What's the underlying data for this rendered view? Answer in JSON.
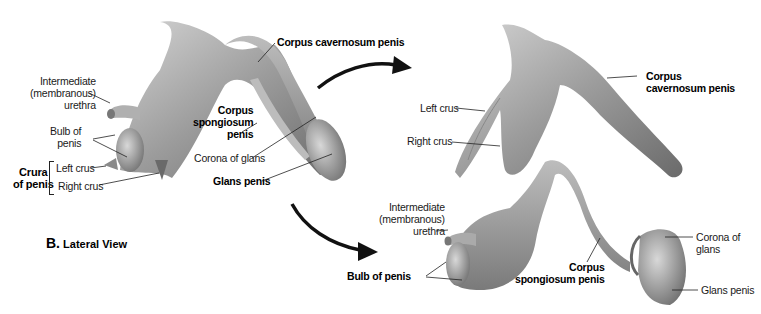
{
  "figure": {
    "caption_letter": "B.",
    "caption_text": "Lateral View"
  },
  "lateral_view_labels": {
    "intermediate_urethra": [
      "Intermediate",
      "(membranous)",
      "urethra"
    ],
    "bulb_of_penis": [
      "Bulb of",
      "penis"
    ],
    "crura_group": [
      "Crura",
      "of penis"
    ],
    "left_crus": "Left crus",
    "right_crus": "Right crus",
    "corpus_cavernosum": "Corpus cavernosum penis",
    "corpus_spongiosum": [
      "Corpus",
      "spongiosum",
      "penis"
    ],
    "corona_of_glans": "Corona of glans",
    "glans_penis": "Glans penis"
  },
  "corpora_cavernosa_view_labels": {
    "left_crus": "Left crus",
    "right_crus": "Right crus",
    "corpus_cavernosum": [
      "Corpus",
      "cavernosum penis"
    ]
  },
  "corpus_spongiosum_view_labels": {
    "intermediate_urethra": [
      "Intermediate",
      "(membranous)",
      "urethra"
    ],
    "bulb_of_penis": "Bulb of penis",
    "corpus_spongiosum": [
      "Corpus",
      "spongiosum penis"
    ],
    "corona_of_glans": [
      "Corona of",
      "glans"
    ],
    "glans_penis": "Glans penis"
  },
  "colors": {
    "tissue_light": "#c9c9c9",
    "tissue_mid": "#9a9a9a",
    "tissue_dark": "#5e5e5e",
    "leader_line": "#222222",
    "arrow": "#111111"
  }
}
